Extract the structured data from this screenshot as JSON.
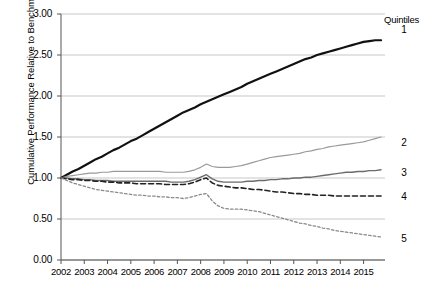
{
  "chart_data": {
    "type": "line",
    "title": "",
    "xlabel": "",
    "ylabel": "Cumulative Performance Relative to Benchmark",
    "legend_title": "Quintiles",
    "legend_position": "right",
    "grid": true,
    "xlim": [
      2002,
      2015.92
    ],
    "ylim": [
      0.0,
      3.0
    ],
    "yticks": [
      "0.00",
      "0.50",
      "1.00",
      "1.50",
      "2.00",
      "2.50",
      "3.00"
    ],
    "ytick_values": [
      0.0,
      0.5,
      1.0,
      1.5,
      2.0,
      2.5,
      3.0
    ],
    "xticks": [
      "2002",
      "2003",
      "2004",
      "2005",
      "2006",
      "2007",
      "2008",
      "2009",
      "2010",
      "2011",
      "2012",
      "2013",
      "2014",
      "2015"
    ],
    "xtick_values": [
      2002,
      2003,
      2004,
      2005,
      2006,
      2007,
      2008,
      2009,
      2010,
      2011,
      2012,
      2013,
      2014,
      2015
    ],
    "x": [
      2002.0,
      2002.25,
      2002.5,
      2002.75,
      2003.0,
      2003.25,
      2003.5,
      2003.75,
      2004.0,
      2004.25,
      2004.5,
      2004.75,
      2005.0,
      2005.25,
      2005.5,
      2005.75,
      2006.0,
      2006.25,
      2006.5,
      2006.75,
      2007.0,
      2007.25,
      2007.5,
      2007.75,
      2008.0,
      2008.25,
      2008.5,
      2008.75,
      2009.0,
      2009.25,
      2009.5,
      2009.75,
      2010.0,
      2010.25,
      2010.5,
      2010.75,
      2011.0,
      2011.25,
      2011.5,
      2011.75,
      2012.0,
      2012.25,
      2012.5,
      2012.75,
      2013.0,
      2013.25,
      2013.5,
      2013.75,
      2014.0,
      2014.25,
      2014.5,
      2014.75,
      2015.0,
      2015.25,
      2015.5,
      2015.75
    ],
    "series": [
      {
        "name": "1",
        "label": "1",
        "style": "solid-thick",
        "color": "#111111",
        "width": 2.2,
        "end_value": 2.68,
        "values": [
          1.0,
          1.04,
          1.08,
          1.11,
          1.15,
          1.19,
          1.23,
          1.26,
          1.3,
          1.34,
          1.37,
          1.41,
          1.45,
          1.48,
          1.52,
          1.56,
          1.6,
          1.64,
          1.68,
          1.72,
          1.76,
          1.8,
          1.83,
          1.86,
          1.9,
          1.93,
          1.96,
          1.99,
          2.02,
          2.05,
          2.08,
          2.11,
          2.15,
          2.18,
          2.21,
          2.24,
          2.27,
          2.3,
          2.33,
          2.36,
          2.39,
          2.42,
          2.45,
          2.47,
          2.5,
          2.52,
          2.54,
          2.56,
          2.58,
          2.6,
          2.62,
          2.64,
          2.66,
          2.67,
          2.68,
          2.68
        ]
      },
      {
        "name": "2",
        "label": "2",
        "style": "solid-light",
        "color": "#9a9a9a",
        "width": 1.2,
        "end_value": 1.5,
        "values": [
          1.0,
          1.02,
          1.03,
          1.04,
          1.05,
          1.06,
          1.06,
          1.07,
          1.07,
          1.08,
          1.08,
          1.08,
          1.08,
          1.08,
          1.08,
          1.08,
          1.08,
          1.08,
          1.07,
          1.07,
          1.07,
          1.07,
          1.08,
          1.1,
          1.13,
          1.17,
          1.14,
          1.13,
          1.13,
          1.13,
          1.14,
          1.15,
          1.17,
          1.19,
          1.21,
          1.23,
          1.25,
          1.26,
          1.27,
          1.28,
          1.29,
          1.3,
          1.32,
          1.33,
          1.35,
          1.36,
          1.38,
          1.39,
          1.4,
          1.41,
          1.42,
          1.43,
          1.44,
          1.46,
          1.48,
          1.5
        ]
      },
      {
        "name": "3",
        "label": "3",
        "style": "solid-mid",
        "color": "#6b6b6b",
        "width": 1.4,
        "end_value": 1.1,
        "values": [
          1.0,
          1.0,
          0.99,
          0.99,
          0.98,
          0.98,
          0.97,
          0.97,
          0.97,
          0.96,
          0.96,
          0.96,
          0.96,
          0.96,
          0.96,
          0.96,
          0.96,
          0.96,
          0.96,
          0.95,
          0.95,
          0.95,
          0.96,
          0.98,
          1.01,
          1.04,
          0.99,
          0.96,
          0.95,
          0.95,
          0.95,
          0.95,
          0.96,
          0.96,
          0.97,
          0.97,
          0.98,
          0.98,
          0.99,
          0.99,
          1.0,
          1.0,
          1.01,
          1.01,
          1.02,
          1.03,
          1.04,
          1.05,
          1.06,
          1.07,
          1.07,
          1.08,
          1.08,
          1.09,
          1.09,
          1.1
        ]
      },
      {
        "name": "4",
        "label": "4",
        "style": "dashed",
        "color": "#222222",
        "width": 1.6,
        "end_value": 0.78,
        "values": [
          1.0,
          0.99,
          0.98,
          0.98,
          0.97,
          0.97,
          0.96,
          0.96,
          0.95,
          0.95,
          0.94,
          0.94,
          0.94,
          0.93,
          0.93,
          0.93,
          0.93,
          0.93,
          0.92,
          0.92,
          0.92,
          0.92,
          0.93,
          0.95,
          0.98,
          1.0,
          0.94,
          0.91,
          0.9,
          0.89,
          0.88,
          0.88,
          0.87,
          0.86,
          0.86,
          0.85,
          0.84,
          0.83,
          0.83,
          0.82,
          0.81,
          0.81,
          0.8,
          0.8,
          0.79,
          0.79,
          0.79,
          0.78,
          0.78,
          0.78,
          0.78,
          0.78,
          0.78,
          0.78,
          0.78,
          0.78
        ]
      },
      {
        "name": "5",
        "label": "5",
        "style": "dotted",
        "color": "#8a8a8a",
        "width": 1.3,
        "end_value": 0.28,
        "values": [
          1.0,
          0.97,
          0.94,
          0.92,
          0.9,
          0.88,
          0.86,
          0.85,
          0.84,
          0.83,
          0.82,
          0.81,
          0.8,
          0.79,
          0.79,
          0.78,
          0.78,
          0.77,
          0.77,
          0.76,
          0.76,
          0.75,
          0.76,
          0.78,
          0.8,
          0.81,
          0.72,
          0.66,
          0.63,
          0.62,
          0.62,
          0.62,
          0.61,
          0.6,
          0.59,
          0.57,
          0.55,
          0.53,
          0.51,
          0.49,
          0.47,
          0.45,
          0.44,
          0.42,
          0.41,
          0.39,
          0.38,
          0.36,
          0.35,
          0.34,
          0.33,
          0.32,
          0.31,
          0.3,
          0.29,
          0.28
        ]
      }
    ]
  }
}
